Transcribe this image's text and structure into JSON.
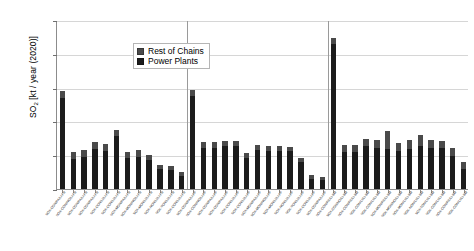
{
  "chart_data": {
    "type": "bar",
    "title": "",
    "xlabel": "",
    "ylabel": "SO2 [kt / year (2020)]",
    "ylabel_base": "SO",
    "ylabel_sub": "2",
    "ylabel_rest": " [kt / year (2020)]",
    "ylim": [
      0,
      2500
    ],
    "yticks": [
      0,
      500,
      1000,
      1500,
      2000,
      2500
    ],
    "grid": true,
    "stacked": true,
    "legend_position": "top-left-inside",
    "legend": [
      "Rest of Chains",
      "Power Plants"
    ],
    "colors": {
      "rest_of_chains": "#4a4a4a",
      "power_plants": "#1c1c1c",
      "gridline": "#d6d6d6",
      "axis": "#8c8c8c",
      "divider": "#9a9a9a",
      "background": "#ffffff"
    },
    "group_dividers_after_index": [
      11,
      24
    ],
    "categories": [
      "SOX-CON/PA/LI-FB",
      "SOX-CON/NO/LI-FB",
      "SOX-CON/PA/LI-FB",
      "SOX-CON/PA/LI-FB",
      "SOX-CON/LI/LI-FB",
      "SOX-CON/LI/LI-FB",
      "SOX-MON/PA/LI-FB",
      "SOX-MON/NO/LI-FB",
      "SOX-MON/LI/LI-FB",
      "SOX-NON/LI/LI-FB",
      "SOX-TON/LI/LI-FB",
      "SOX-CON/LI/LI-FB",
      "SOX-CON/PA/LI-PF",
      "SOX-CON/NO/LI-PF",
      "SOX-CON/PA/LI-PF",
      "SOX-CON/PA/LI-PF",
      "SOX-CON/LI/LI-PF",
      "SOX-CON/LI/LI-PF",
      "SOX-MON/PA/LI-PF",
      "SOX-MON/NO/LI-PF",
      "SOX-MON/LI/LI-PF",
      "SOX-NON/LI/LI-PF",
      "SOX-TON/LI/LI-PF",
      "SOX-CON/LI/LI-PF",
      "SOX-CON/PA/LI-PF",
      "SOX-CON/PA/LI-BM",
      "SOX-CON/NO/LI-BM",
      "SOX-CON/PA/LI-BM",
      "SOX-CON/LI/LI-BM",
      "SOX-CON/LI/LI-BM",
      "SOX-MON/PA/LI-BM",
      "SOX-MON/NO/LI-BM",
      "SOX-MON/LI/LI-BM",
      "SOX-NON/LI/LI-BM",
      "SOX-TON/LI/LI-BM",
      "SOX-CON/LI/LI-BM",
      "SOX-CON/PA/LI-BM",
      "SOX-CON/LI/LI-BM"
    ],
    "series": [
      {
        "name": "Power Plants",
        "values": [
          1340,
          450,
          470,
          590,
          555,
          780,
          455,
          470,
          430,
          290,
          285,
          195,
          1370,
          610,
          610,
          635,
          640,
          465,
          575,
          565,
          560,
          555,
          405,
          155,
          130,
          2150,
          545,
          545,
          630,
          605,
          595,
          555,
          595,
          640,
          605,
          600,
          490,
          300
        ]
      },
      {
        "name": "Rest of Chains",
        "values": [
          110,
          105,
          105,
          100,
          105,
          90,
          90,
          100,
          80,
          60,
          50,
          55,
          90,
          80,
          80,
          75,
          70,
          70,
          70,
          70,
          70,
          60,
          55,
          55,
          50,
          90,
          110,
          105,
          115,
          115,
          270,
          130,
          135,
          155,
          120,
          115,
          110,
          95
        ]
      }
    ]
  }
}
